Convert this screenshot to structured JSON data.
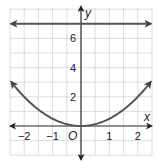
{
  "chart_data": {
    "type": "line",
    "title": "",
    "xlabel": "x",
    "ylabel": "y",
    "origin_label": "O",
    "xlim": [
      -2.5,
      2.5
    ],
    "ylim": [
      -2,
      8
    ],
    "x_grid_step": 0.5,
    "y_grid_step": 1,
    "grid": true,
    "x_ticks": [
      {
        "value": -2,
        "label": "−2"
      },
      {
        "value": -1,
        "label": "−1"
      },
      {
        "value": 1,
        "label": "1"
      },
      {
        "value": 2,
        "label": "2"
      }
    ],
    "y_ticks": [
      {
        "value": 2,
        "label": "2"
      },
      {
        "value": 4,
        "label": "4"
      },
      {
        "value": 6,
        "label": "6"
      }
    ],
    "series": [
      {
        "name": "parabola",
        "equation": "y = 0.5x^2",
        "coefficient": 0.5,
        "x_range": [
          -2.45,
          2.45
        ],
        "arrows": "both",
        "color": "#555555"
      },
      {
        "name": "horizontal line",
        "equation": "y = 7",
        "constant": 7,
        "x_range": [
          -2.45,
          2.45
        ],
        "arrows": "both",
        "color": "#555555"
      }
    ]
  }
}
